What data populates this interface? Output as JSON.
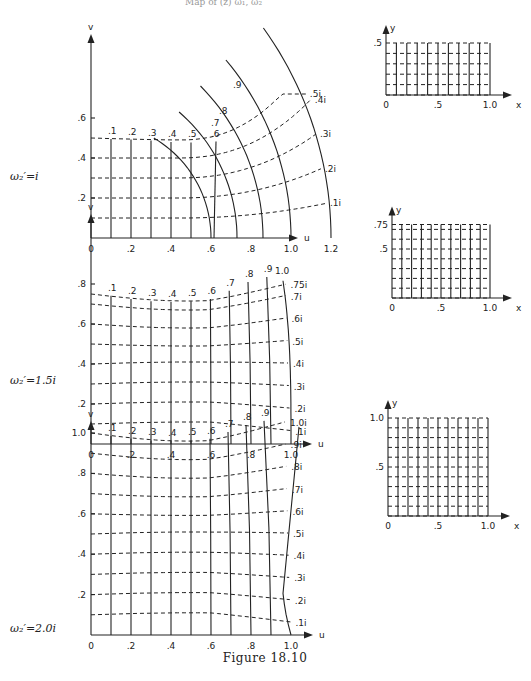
{
  "page": {
    "header_fragment": "Map of (z) ω₁, ω₂",
    "caption": "Figure 18.10"
  },
  "chart_data": [
    {
      "type": "line",
      "title": "w-plane mapping",
      "parameter_label": "ω₂′=i",
      "xlabel": "u",
      "ylabel": "v",
      "xticks": [
        "0",
        ".2",
        ".4",
        ".6",
        ".8",
        "1.0",
        "1.2"
      ],
      "yticks": [
        ".2",
        ".4",
        ".6"
      ],
      "xlim": [
        0,
        1.2
      ],
      "ylim": [
        0,
        0.6
      ],
      "curve_labels_x": [
        ".1",
        ".2",
        ".3",
        ".4",
        ".5",
        ".6",
        ".7",
        ".8",
        ".9"
      ],
      "curve_labels_y": [
        ".1i",
        ".2i",
        ".3i",
        ".4i",
        ".5i"
      ],
      "x_curves_u_at_base": [
        0.1,
        0.2,
        0.3,
        0.4,
        0.5,
        0.6,
        0.73,
        0.86,
        1.0,
        1.2
      ],
      "y_curves_v_at_axis": [
        0.1,
        0.2,
        0.3,
        0.4,
        0.5
      ]
    },
    {
      "type": "line",
      "title": "z-plane grid",
      "xlabel": "x",
      "ylabel": "y",
      "xticks": [
        "0",
        ".5",
        "1.0"
      ],
      "yticks": [
        ".5"
      ],
      "xlim": [
        0,
        1.0
      ],
      "ylim": [
        0,
        0.5
      ],
      "x_grid": [
        0.1,
        0.2,
        0.3,
        0.4,
        0.5,
        0.6,
        0.7,
        0.8,
        0.9,
        1.0
      ],
      "y_grid": [
        0.1,
        0.2,
        0.3,
        0.4,
        0.5
      ]
    },
    {
      "type": "line",
      "title": "w-plane mapping",
      "parameter_label": "ω₂′=1.5i",
      "xlabel": "u",
      "ylabel": "v",
      "xticks": [
        "0",
        ".2",
        ".4",
        ".6",
        ".8",
        "1.0"
      ],
      "yticks": [
        ".2",
        ".4",
        ".6",
        ".8"
      ],
      "xlim": [
        0,
        1.0
      ],
      "ylim": [
        0,
        0.8
      ],
      "curve_labels_x": [
        ".1",
        ".2",
        ".3",
        ".4",
        ".5",
        ".6",
        ".7",
        ".8",
        ".9",
        "1.0"
      ],
      "curve_labels_y": [
        ".1i",
        ".2i",
        ".3i",
        ".4i",
        ".5i",
        ".6i",
        ".7i",
        ".75i"
      ],
      "y_curves_v_at_axis": [
        0.1,
        0.2,
        0.3,
        0.4,
        0.5,
        0.6,
        0.7,
        0.75
      ]
    },
    {
      "type": "line",
      "title": "z-plane grid",
      "xlabel": "x",
      "ylabel": "y",
      "xticks": [
        "0",
        ".5",
        "1.0"
      ],
      "yticks": [
        ".5",
        ".75"
      ],
      "xlim": [
        0,
        1.0
      ],
      "ylim": [
        0,
        0.75
      ],
      "x_grid": [
        0.1,
        0.2,
        0.3,
        0.4,
        0.5,
        0.6,
        0.7,
        0.8,
        0.9,
        1.0
      ],
      "y_grid": [
        0.1,
        0.2,
        0.3,
        0.4,
        0.5,
        0.6,
        0.7,
        0.75
      ]
    },
    {
      "type": "line",
      "title": "w-plane mapping",
      "parameter_label": "ω₂′=2.0i",
      "xlabel": "u",
      "ylabel": "v",
      "xticks": [
        "0",
        ".2",
        ".4",
        ".6",
        ".8",
        "1.0"
      ],
      "yticks": [
        ".2",
        ".4",
        ".6",
        ".8",
        "1.0"
      ],
      "xlim": [
        0,
        1.0
      ],
      "ylim": [
        0,
        1.0
      ],
      "curve_labels_x": [
        ".1",
        ".2",
        ".3",
        ".4",
        ".5",
        ".6",
        ".7",
        ".8",
        ".9"
      ],
      "curve_labels_y": [
        ".1i",
        ".2i",
        ".3i",
        ".4i",
        ".5i",
        ".6i",
        ".7i",
        ".8i",
        ".9i",
        "1.0i"
      ],
      "y_curves_v_at_axis": [
        0.1,
        0.2,
        0.3,
        0.4,
        0.5,
        0.6,
        0.7,
        0.8,
        0.9,
        1.0
      ]
    },
    {
      "type": "line",
      "title": "z-plane grid",
      "xlabel": "x",
      "ylabel": "y",
      "xticks": [
        "0",
        ".5",
        "1.0"
      ],
      "yticks": [
        ".5",
        "1.0"
      ],
      "xlim": [
        0,
        1.0
      ],
      "ylim": [
        0,
        1.0
      ],
      "x_grid": [
        0.1,
        0.2,
        0.3,
        0.4,
        0.5,
        0.6,
        0.7,
        0.8,
        0.9,
        1.0
      ],
      "y_grid": [
        0.1,
        0.2,
        0.3,
        0.4,
        0.5,
        0.6,
        0.7,
        0.8,
        0.9,
        1.0
      ]
    }
  ]
}
